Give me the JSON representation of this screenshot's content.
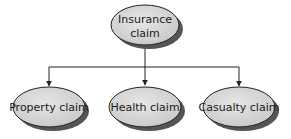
{
  "diagram": {
    "type": "hierarchy",
    "colors": {
      "node_fill": "#d8d8d8",
      "node_stroke": "#222222",
      "shadow": "#555555",
      "line": "#222222"
    },
    "root": {
      "lines": [
        "Insurance",
        "claim"
      ]
    },
    "children": [
      {
        "label": "Property claim"
      },
      {
        "label": "Health claim"
      },
      {
        "label": "Casualty claim"
      }
    ]
  }
}
